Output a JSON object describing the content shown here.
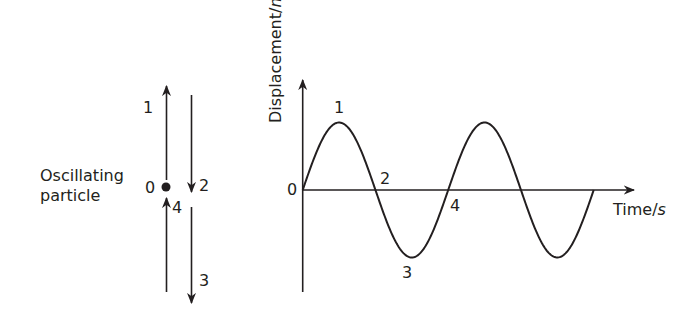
{
  "particle_panel": {
    "caption_line1": "Oscillating",
    "caption_line2": "particle",
    "labels": {
      "p0": "0",
      "p1": "1",
      "p2": "2",
      "p3": "3",
      "p4": "4"
    },
    "arrows": [
      "up-upper",
      "down-upper",
      "up-lower",
      "down-lower"
    ]
  },
  "graph": {
    "y_axis_label_main": "Displacement/",
    "y_axis_label_unit": "m",
    "x_axis_label_main": "Time/",
    "x_axis_label_unit": "s",
    "origin_label": "0",
    "point_labels": {
      "p1": "1",
      "p2": "2",
      "p3": "3",
      "p4": "4"
    },
    "cycles_shown": 2,
    "curve": "sine"
  },
  "colors": {
    "ink": "#231f20",
    "background": "#ffffff"
  }
}
